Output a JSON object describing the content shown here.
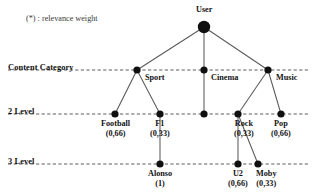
{
  "legend": {
    "note": "(*) : relevance weight"
  },
  "axis_labels": [
    {
      "id": "content-category",
      "text": "Content Category",
      "x": 8,
      "y": 63,
      "line_y": 70
    },
    {
      "id": "level-2",
      "text": "2 Level",
      "x": 8,
      "y": 107,
      "line_y": 114
    },
    {
      "id": "level-3",
      "text": "3 Level",
      "x": 8,
      "y": 157,
      "line_y": 164
    }
  ],
  "colors": {
    "node_fill": "#101010",
    "edge": "#5a5a5a",
    "dashed_line": "#4a4a4a",
    "text": "#121212",
    "background": "#ffffff"
  },
  "chart_data": {
    "type": "diagram",
    "nodes": [
      {
        "id": "user",
        "label": "User",
        "weight": "",
        "x": 204,
        "y": 27,
        "r": 6.2,
        "label_pos": "above",
        "label_x": 204,
        "label_y": 5
      },
      {
        "id": "sport",
        "label": "Sport",
        "weight": "",
        "x": 137,
        "y": 70,
        "r": 3.6,
        "label_pos": "right",
        "label_x": 145,
        "label_y": 73
      },
      {
        "id": "cinema",
        "label": "Cinema",
        "weight": "",
        "x": 204,
        "y": 70,
        "r": 3.6,
        "label_pos": "right",
        "label_x": 211,
        "label_y": 73
      },
      {
        "id": "music",
        "label": "Music",
        "weight": "",
        "x": 268,
        "y": 70,
        "r": 3.6,
        "label_pos": "right",
        "label_x": 276,
        "label_y": 73
      },
      {
        "id": "football",
        "label": "Football",
        "weight": "(0,66)",
        "x": 115,
        "y": 114,
        "r": 3.6,
        "label_pos": "below",
        "label_x": 115,
        "label_y": 119
      },
      {
        "id": "f1",
        "label": "F1",
        "weight": "(0,33)",
        "x": 160,
        "y": 114,
        "r": 3.6,
        "label_pos": "below",
        "label_x": 160,
        "label_y": 119
      },
      {
        "id": "cinema2",
        "label": "",
        "weight": "",
        "x": 204,
        "y": 114,
        "r": 3.6,
        "label_pos": "none",
        "label_x": 204,
        "label_y": 119
      },
      {
        "id": "rock",
        "label": "Rock",
        "weight": "(0,33)",
        "x": 238,
        "y": 114,
        "r": 3.6,
        "label_pos": "below",
        "label_x": 244,
        "label_y": 119
      },
      {
        "id": "pop",
        "label": "Pop",
        "weight": "(0,66)",
        "x": 281,
        "y": 114,
        "r": 3.6,
        "label_pos": "below",
        "label_x": 281,
        "label_y": 119
      },
      {
        "id": "alonso",
        "label": "Alonso",
        "weight": "(1)",
        "x": 160,
        "y": 164,
        "r": 3.6,
        "label_pos": "below",
        "label_x": 160,
        "label_y": 169
      },
      {
        "id": "u2",
        "label": "U2",
        "weight": "(0,66)",
        "x": 238,
        "y": 164,
        "r": 3.6,
        "label_pos": "below",
        "label_x": 238,
        "label_y": 169
      },
      {
        "id": "moby",
        "label": "Moby",
        "weight": "(0,33)",
        "x": 258,
        "y": 164,
        "r": 3.6,
        "label_pos": "below",
        "label_x": 266,
        "label_y": 169
      }
    ],
    "edges": [
      {
        "from": "user",
        "to": "sport"
      },
      {
        "from": "user",
        "to": "cinema"
      },
      {
        "from": "user",
        "to": "music"
      },
      {
        "from": "sport",
        "to": "football"
      },
      {
        "from": "sport",
        "to": "f1"
      },
      {
        "from": "cinema",
        "to": "cinema2"
      },
      {
        "from": "music",
        "to": "rock"
      },
      {
        "from": "music",
        "to": "pop"
      },
      {
        "from": "f1",
        "to": "alonso"
      },
      {
        "from": "rock",
        "to": "u2"
      },
      {
        "from": "rock",
        "to": "moby"
      }
    ],
    "levels": [
      "Content Category",
      "2 Level",
      "3 Level"
    ],
    "legend": "(*) : relevance weight"
  }
}
